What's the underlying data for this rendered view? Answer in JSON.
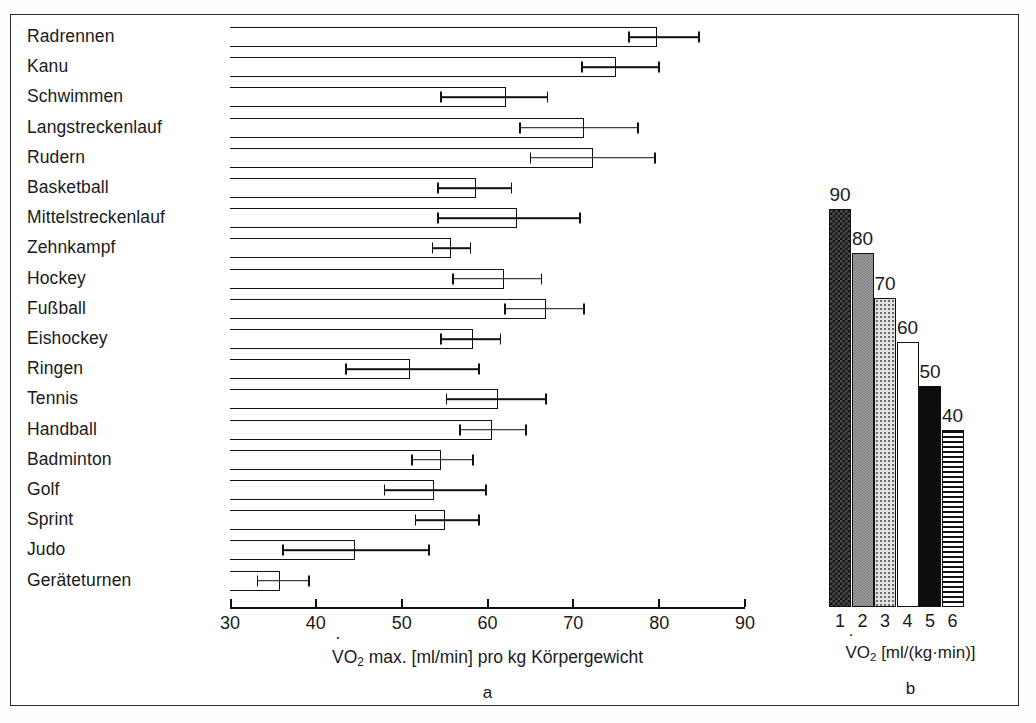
{
  "chart_data": [
    {
      "type": "bar",
      "orientation": "horizontal",
      "panel": "a",
      "title": "",
      "xlabel": "VO2 max. [ml/min] pro kg Körpergewicht",
      "ylabel": "",
      "xlim": [
        30,
        90
      ],
      "xticks": [
        30,
        40,
        50,
        60,
        70,
        80,
        90
      ],
      "grid": false,
      "categories": [
        "Radrennen",
        "Kanu",
        "Schwimmen",
        "Langstreckenlauf",
        "Rudern",
        "Basketball",
        "Mittelstreckenlauf",
        "Zehnkampf",
        "Hockey",
        "Fußball",
        "Eishockey",
        "Ringen",
        "Tennis",
        "Handball",
        "Badminton",
        "Golf",
        "Sprint",
        "Judo",
        "Geräteturnen"
      ],
      "values": [
        79.8,
        75.0,
        62.2,
        71.3,
        72.3,
        58.7,
        63.4,
        55.8,
        61.9,
        66.8,
        58.3,
        51.0,
        61.2,
        60.5,
        54.6,
        53.8,
        55.0,
        44.6,
        35.8
      ],
      "error_low": [
        76.5,
        71.0,
        54.6,
        63.8,
        65.0,
        54.2,
        54.2,
        53.6,
        56.0,
        62.0,
        54.6,
        43.5,
        55.2,
        56.8,
        51.2,
        48.0,
        51.6,
        36.2,
        33.2
      ],
      "error_high": [
        84.6,
        80.0,
        67.0,
        77.5,
        79.5,
        62.8,
        70.8,
        58.0,
        66.3,
        71.2,
        61.5,
        59.0,
        66.8,
        64.5,
        58.3,
        59.8,
        59.0,
        53.2,
        39.2
      ]
    },
    {
      "type": "bar",
      "orientation": "vertical",
      "panel": "b",
      "title": "",
      "xlabel": "VO2 [ml/(kg·min)]",
      "ylabel": "",
      "ylim": [
        0,
        95
      ],
      "grid": false,
      "categories": [
        "1",
        "2",
        "3",
        "4",
        "5",
        "6"
      ],
      "values": [
        90,
        80,
        70,
        60,
        50,
        40
      ],
      "value_labels": [
        "90",
        "80",
        "70",
        "60",
        "50",
        "40"
      ],
      "fills": [
        "checkerboard-dark",
        "solid-gray",
        "light-dotted",
        "white",
        "black",
        "horizontal-stripes"
      ]
    }
  ],
  "panel_a": {
    "tag": "a",
    "axis_label": {
      "v": "V",
      "sub": "O",
      "sub2": "2",
      "rest": " max. [ml/min] pro kg Körpergewicht"
    },
    "rows": [
      {
        "label": "Radrennen"
      },
      {
        "label": "Kanu"
      },
      {
        "label": "Schwimmen"
      },
      {
        "label": "Langstreckenlauf"
      },
      {
        "label": "Rudern"
      },
      {
        "label": "Basketball"
      },
      {
        "label": "Mittelstreckenlauf"
      },
      {
        "label": "Zehnkampf"
      },
      {
        "label": "Hockey"
      },
      {
        "label": "Fußball"
      },
      {
        "label": "Eishockey"
      },
      {
        "label": "Ringen"
      },
      {
        "label": "Tennis"
      },
      {
        "label": "Handball"
      },
      {
        "label": "Badminton"
      },
      {
        "label": "Golf"
      },
      {
        "label": "Sprint"
      },
      {
        "label": "Judo"
      },
      {
        "label": "Geräteturnen"
      }
    ],
    "ticks": [
      "30",
      "40",
      "50",
      "60",
      "70",
      "80",
      "90"
    ]
  },
  "panel_b": {
    "tag": "b",
    "axis_label_rest": " [ml/(kg·min)]",
    "bars": [
      {
        "label": "90",
        "cat": "1"
      },
      {
        "label": "80",
        "cat": "2"
      },
      {
        "label": "70",
        "cat": "3"
      },
      {
        "label": "60",
        "cat": "4"
      },
      {
        "label": "50",
        "cat": "5"
      },
      {
        "label": "40",
        "cat": "6"
      }
    ]
  },
  "colors": {
    "ink": "#111111",
    "frame": "#2b2b2b",
    "background": "#ffffff",
    "gray_fill": "#9a9a9a",
    "dotted_fill": "#e2e2e2",
    "black_fill": "#0d0d0d"
  }
}
